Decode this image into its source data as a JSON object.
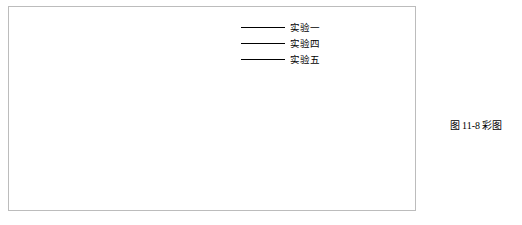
{
  "chart_data": {
    "type": "line",
    "title": "",
    "xlabel": "Steps_per_epochs",
    "ylabel": "Loss",
    "xlim": [
      -1.5,
      37.5
    ],
    "ylim": [
      0.0,
      2.45
    ],
    "grid": true,
    "legend_position": "top-right",
    "xticks": [
      "0.00",
      "5.00",
      "10.00",
      "15.00",
      "20.00",
      "25.00",
      "30.00",
      "35.00"
    ],
    "xtick_values": [
      0,
      5,
      10,
      15,
      20,
      25,
      30,
      35
    ],
    "yticks": [
      "0.00",
      "0.20",
      "0.40",
      "0.60",
      "0.80",
      "1.00",
      "1.20",
      "1.40",
      "1.60",
      "1.80",
      "2.00"
    ],
    "ytick_values": [
      0.0,
      0.2,
      0.4,
      0.6,
      0.8,
      1.0,
      1.2,
      1.4,
      1.6,
      1.8,
      2.0
    ],
    "x": [
      0,
      1,
      2,
      3,
      4,
      5,
      6,
      7,
      8,
      9,
      10,
      11,
      12,
      13,
      14,
      15,
      16,
      17,
      18,
      19,
      20,
      21,
      22,
      23,
      24,
      25,
      26,
      27,
      28,
      29,
      30,
      31,
      32,
      33,
      34,
      35,
      36
    ],
    "series": [
      {
        "name": "实验一",
        "color": "#3a3a3a",
        "values": [
          2.44,
          1.72,
          1.3,
          1.03,
          0.88,
          0.79,
          0.73,
          0.69,
          0.66,
          0.635,
          0.615,
          0.6,
          0.585,
          0.572,
          0.56,
          0.549,
          0.539,
          0.53,
          0.521,
          0.513,
          0.505,
          0.498,
          0.491,
          0.484,
          0.478,
          0.472,
          0.466,
          0.46,
          0.454,
          0.449,
          0.444,
          0.439,
          0.434,
          0.43,
          0.426,
          0.422,
          0.419
        ]
      },
      {
        "name": "实验四",
        "color": "#1d1d1d",
        "values": [
          2.45,
          1.88,
          1.38,
          1.05,
          0.86,
          0.755,
          0.695,
          0.655,
          0.625,
          0.6,
          0.578,
          0.558,
          0.54,
          0.524,
          0.509,
          0.495,
          0.482,
          0.47,
          0.459,
          0.449,
          0.44,
          0.431,
          0.423,
          0.415,
          0.408,
          0.401,
          0.395,
          0.389,
          0.383,
          0.378,
          0.373,
          0.368,
          0.363,
          0.358,
          0.353,
          0.348,
          0.344
        ]
      },
      {
        "name": "实验五",
        "color": "#6e6e6e",
        "values": [
          2.3,
          1.6,
          1.22,
          0.98,
          0.83,
          0.735,
          0.672,
          0.628,
          0.595,
          0.569,
          0.547,
          0.528,
          0.511,
          0.496,
          0.482,
          0.469,
          0.457,
          0.446,
          0.436,
          0.426,
          0.417,
          0.408,
          0.4,
          0.392,
          0.384,
          0.377,
          0.37,
          0.363,
          0.357,
          0.351,
          0.345,
          0.339,
          0.334,
          0.329,
          0.324,
          0.319,
          0.315
        ]
      },
      {
        "name": "实验二",
        "color": "#b9b9b9",
        "values": [
          2.2,
          1.52,
          1.12,
          0.9,
          0.775,
          0.7,
          0.65,
          0.612,
          0.582,
          0.558,
          0.537,
          0.519,
          0.503,
          0.488,
          0.475,
          0.462,
          0.451,
          0.44,
          0.43,
          0.421,
          0.412,
          0.404,
          0.396,
          0.389,
          0.382,
          0.375,
          0.369,
          0.363,
          0.357,
          0.352,
          0.346,
          0.341,
          0.336,
          0.332,
          0.327,
          0.323,
          0.319
        ]
      },
      {
        "name": "实验三",
        "color": "#cfcfcf",
        "values": [
          2.05,
          1.4,
          1.05,
          0.86,
          0.745,
          0.678,
          0.632,
          0.598,
          0.571,
          0.549,
          0.531,
          0.514,
          0.5,
          0.487,
          0.475,
          0.464,
          0.454,
          0.445,
          0.436,
          0.428,
          0.42,
          0.413,
          0.406,
          0.4,
          0.394,
          0.388,
          0.382,
          0.377,
          0.372,
          0.367,
          0.362,
          0.358,
          0.353,
          0.349,
          0.345,
          0.341,
          0.337
        ]
      }
    ]
  },
  "legend": {
    "items": [
      {
        "label": "实验一",
        "color": "#3a3a3a"
      },
      {
        "label": "实验四",
        "color": "#1d1d1d"
      },
      {
        "label": "实验五",
        "color": "#6e6e6e"
      }
    ]
  },
  "figure": {
    "caption": "图 11-8 彩图",
    "qr_alt": "qr-code"
  }
}
